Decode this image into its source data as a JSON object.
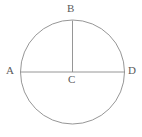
{
  "figure": {
    "kind": "circle-diagram",
    "background_color": "#ffffff",
    "stroke_color": "#8a8a8a",
    "label_color": "#5a5a5a",
    "stroke_width": 0.9,
    "width": 142,
    "height": 137
  },
  "labels": {
    "a": "A",
    "b": "B",
    "c": "C",
    "d": "D"
  },
  "geometry": {
    "circle": {
      "cx": 72.5,
      "cy": 72,
      "r": 52
    },
    "diameter_line": {
      "x1": 20.5,
      "y1": 72,
      "x2": 124.5,
      "y2": 72
    },
    "radius_line": {
      "x1": 72.5,
      "y1": 72,
      "x2": 72.5,
      "y2": 20.5
    }
  }
}
